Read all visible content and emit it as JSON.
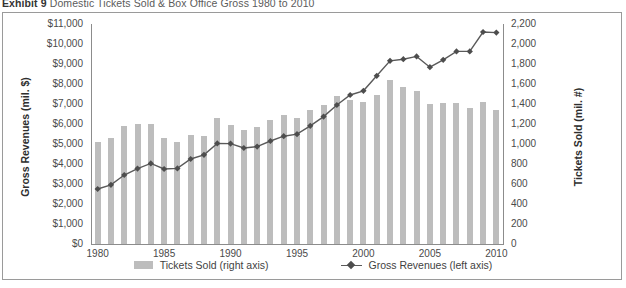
{
  "exhibit": {
    "label": "Exhibit 9",
    "title": "Domestic Tickets Sold & Box Office Gross 1980 to 2010"
  },
  "legend": {
    "bars_label": "Tickets Sold (right axis)",
    "line_label": "Gross Revenues (left axis)"
  },
  "colors": {
    "bar": "#bdbdbd",
    "line": "#5a5a5a",
    "marker": "#4d4d4d",
    "frame": "#9a9a9a",
    "text": "#3c3c3c"
  },
  "chart_data": {
    "type": "bar",
    "title": "Domestic Tickets Sold & Box Office Gross 1980 to 2010",
    "xlabel": "",
    "ylabel": "Gross Revenues (mil. $)",
    "y2label": "Tickets Sold (mil. #)",
    "grid": false,
    "legend_position": "bottom-center",
    "categories": [
      "1980",
      "1981",
      "1982",
      "1983",
      "1984",
      "1985",
      "1986",
      "1987",
      "1988",
      "1989",
      "1990",
      "1991",
      "1992",
      "1993",
      "1994",
      "1995",
      "1996",
      "1997",
      "1998",
      "1999",
      "2000",
      "2001",
      "2002",
      "2003",
      "2004",
      "2005",
      "2006",
      "2007",
      "2008",
      "2009",
      "2010"
    ],
    "xticklabels": [
      "1980",
      "1985",
      "1990",
      "1995",
      "2000",
      "2005",
      "2010"
    ],
    "ylim": [
      0,
      11000
    ],
    "yticks": [
      0,
      1000,
      2000,
      3000,
      4000,
      5000,
      6000,
      7000,
      8000,
      9000,
      10000,
      11000
    ],
    "yticklabels": [
      "$0",
      "$1,000",
      "$2,000",
      "$3,000",
      "$4,000",
      "$5,000",
      "$6,000",
      "$7,000",
      "$8,000",
      "$9,000",
      "$10,000",
      "$11,000"
    ],
    "y2lim": [
      0,
      2200
    ],
    "y2ticks": [
      0,
      200,
      400,
      600,
      800,
      1000,
      1200,
      1400,
      1600,
      1800,
      2000,
      2200
    ],
    "y2ticklabels": [
      "0",
      "200",
      "400",
      "600",
      "800",
      "1,000",
      "1,200",
      "1,400",
      "1,600",
      "1,800",
      "2,000",
      "2,200"
    ],
    "series": [
      {
        "name": "Tickets Sold (right axis)",
        "type": "bar",
        "axis": "right",
        "unit": "mil. #",
        "values": [
          1020,
          1060,
          1180,
          1200,
          1200,
          1060,
          1020,
          1090,
          1085,
          1260,
          1190,
          1140,
          1170,
          1240,
          1290,
          1260,
          1340,
          1390,
          1480,
          1440,
          1420,
          1490,
          1640,
          1570,
          1530,
          1400,
          1410,
          1410,
          1360,
          1420,
          1340
        ]
      },
      {
        "name": "Gross Revenues (left axis)",
        "type": "line",
        "axis": "left",
        "unit": "mil. $",
        "values": [
          2750,
          2960,
          3450,
          3770,
          4030,
          3750,
          3780,
          4250,
          4460,
          5030,
          5020,
          4800,
          4870,
          5150,
          5390,
          5490,
          5910,
          6370,
          6950,
          7450,
          7660,
          8410,
          9160,
          9240,
          9380,
          8840,
          9210,
          9630,
          9630,
          10600,
          10570
        ]
      }
    ]
  }
}
